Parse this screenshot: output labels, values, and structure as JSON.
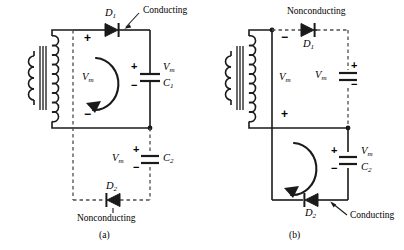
{
  "figure": {
    "type": "circuit-diagram",
    "panels": [
      {
        "id": "a",
        "caption": "(a)",
        "transformer": {
          "name": "transformer",
          "secondary_top_polarity": "+",
          "secondary_bottom_polarity": "−",
          "secondary_voltage_label": "V",
          "secondary_voltage_sub": "m"
        },
        "diodes": [
          {
            "name": "D1",
            "label": "D",
            "sub": "1",
            "state": "Conducting",
            "direction": "right"
          },
          {
            "name": "D2",
            "label": "D",
            "sub": "2",
            "state": "Nonconducting",
            "direction": "left"
          }
        ],
        "capacitors": [
          {
            "name": "C1",
            "label": "C",
            "sub": "1",
            "voltage": "V",
            "voltage_sub": "m",
            "plus": "+",
            "minus": "−",
            "branch": "solid"
          },
          {
            "name": "C2",
            "label": "C",
            "sub": "2",
            "voltage": "V",
            "voltage_sub": "m",
            "plus": "+",
            "minus": "−",
            "branch": "dashed"
          }
        ],
        "annotations": [
          {
            "text": "Conducting",
            "target": "D1"
          },
          {
            "text": "Nonconducting",
            "target": "D2"
          }
        ],
        "current_loop": {
          "name": "current-loop-arrow",
          "direction": "counterclockwise",
          "location": "upper"
        }
      },
      {
        "id": "b",
        "caption": "(b)",
        "transformer": {
          "name": "transformer",
          "secondary_top_polarity": "−",
          "secondary_bottom_polarity": "+",
          "secondary_voltage_label": "V",
          "secondary_voltage_sub": "m"
        },
        "diodes": [
          {
            "name": "D1",
            "label": "D",
            "sub": "1",
            "state": "Nonconducting",
            "direction": "right"
          },
          {
            "name": "D2",
            "label": "D",
            "sub": "2",
            "state": "Conducting",
            "direction": "left"
          }
        ],
        "capacitors": [
          {
            "name": "C1",
            "label": "",
            "sub": "",
            "voltage": "V",
            "voltage_sub": "m",
            "plus": "+",
            "minus": "−",
            "branch": "dashed"
          },
          {
            "name": "C2",
            "label": "C",
            "sub": "2",
            "voltage": "V",
            "voltage_sub": "m",
            "plus": "+",
            "minus": "−",
            "branch": "solid"
          }
        ],
        "annotations": [
          {
            "text": "Nonconducting",
            "target": "D1"
          },
          {
            "text": "Conducting",
            "target": "D2"
          }
        ],
        "current_loop": {
          "name": "current-loop-arrow",
          "direction": "counterclockwise",
          "location": "lower"
        }
      }
    ],
    "colors": {
      "wire": "#1a1a1a",
      "dashed_wire": "#4d4d4d",
      "background": "#ffffff",
      "text": "#000000"
    }
  }
}
